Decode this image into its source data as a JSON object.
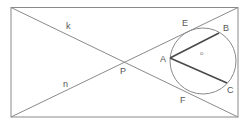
{
  "diagram": {
    "lines": {
      "k": "k",
      "n": "n"
    },
    "points": {
      "P": "P",
      "A": "A",
      "B": "B",
      "C": "C",
      "E": "E",
      "F": "F"
    },
    "center_marker": "o",
    "colors": {
      "line": "#8a8a8a",
      "chord": "#4a4a4a",
      "label": "#555555"
    }
  }
}
